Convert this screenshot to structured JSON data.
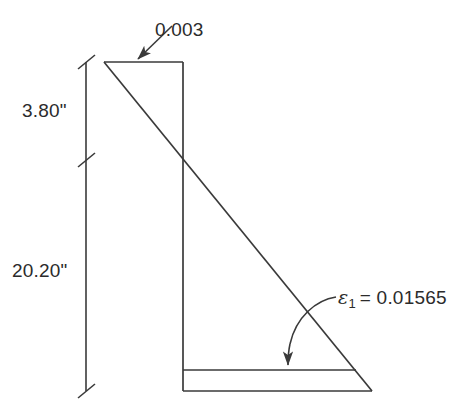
{
  "figure": {
    "type": "strain-distribution-diagram",
    "title": "",
    "stroke_color": "#3a3a3a",
    "text_color": "#2b2b2b",
    "background_color": "#ffffff"
  },
  "annotations": {
    "top_strain": {
      "value": "0.003",
      "icon": "leader-arrow-straight"
    },
    "bottom_strain": {
      "symbol": "ε",
      "subscript": "1",
      "equals_value": "= 0.01565",
      "full_text": "ε1 = 0.01565",
      "icon": "leader-arrow-curved"
    }
  },
  "dimensions": {
    "upper": {
      "value": "3.80\"",
      "span_from_y": 62,
      "span_to_y": 160
    },
    "lower": {
      "value": "20.20\"",
      "span_from_y": 160,
      "span_to_y": 391
    },
    "line_x": 86,
    "tick_style": "slash"
  },
  "geometry": {
    "apex": [
      104,
      62
    ],
    "top_edge": [
      [
        104,
        62
      ],
      [
        183,
        62
      ]
    ],
    "neutral_axis_vertical": [
      [
        183,
        62
      ],
      [
        183,
        391
      ]
    ],
    "diagonal": [
      [
        104,
        62
      ],
      [
        372,
        391
      ]
    ],
    "neutral_axis_crossing": [
      183,
      160
    ],
    "steel_level_line": [
      [
        183,
        370
      ],
      [
        356,
        370
      ]
    ],
    "base_line": [
      [
        183,
        391
      ],
      [
        372,
        391
      ]
    ]
  }
}
